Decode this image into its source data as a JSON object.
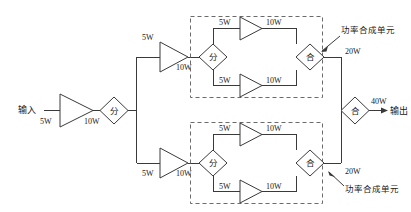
{
  "diagram": {
    "colors": {
      "line": "#3a3a3a",
      "dashed": "#6b6b6b",
      "text": "#1a1a1a",
      "background": "#ffffff"
    },
    "io": {
      "input_label": "输入",
      "output_label": "输出",
      "input_power": "5W",
      "output_power": "40W"
    },
    "nodes": {
      "input_amp_out": "10W",
      "splitter_symbol": "分",
      "combiner_symbol": "合"
    },
    "stage2": {
      "top_amp_in": "5W",
      "top_amp_out": "10W",
      "bottom_amp_in": "5W",
      "bottom_amp_out": "10W"
    },
    "units": [
      {
        "id": "top-power-combining-unit",
        "annotation": "功率合成单元",
        "output_power": "20W",
        "splitter_symbol": "分",
        "combiner_symbol": "合",
        "branches": [
          {
            "in": "5W",
            "out": "10W"
          },
          {
            "in": "5W",
            "out": "10W"
          }
        ]
      },
      {
        "id": "bottom-power-combining-unit",
        "annotation": "功率合成单元",
        "output_power": "20W",
        "splitter_symbol": "分",
        "combiner_symbol": "合",
        "branches": [
          {
            "in": "5W",
            "out": "10W"
          },
          {
            "in": "5W",
            "out": "10W"
          }
        ]
      }
    ]
  }
}
